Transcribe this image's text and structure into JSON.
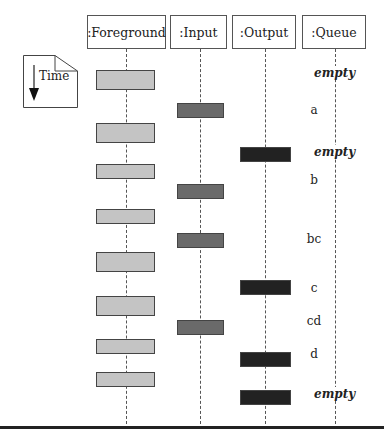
{
  "lifelines": [
    {
      "label": ":Foreground",
      "x": 125
    },
    {
      "label": ":Input",
      "x": 199
    },
    {
      "label": ":Output",
      "x": 265
    },
    {
      "label": ":Queue",
      "x": 335
    }
  ],
  "note": {
    "label": "Time"
  },
  "queue_states": [
    {
      "label": "empty",
      "y": 74,
      "italic": true
    },
    {
      "label": "a",
      "y": 111,
      "italic": false
    },
    {
      "label": "empty",
      "y": 153,
      "italic": true
    },
    {
      "label": "b",
      "y": 181,
      "italic": false
    },
    {
      "label": "bc",
      "y": 240,
      "italic": false
    },
    {
      "label": "c",
      "y": 289,
      "italic": false
    },
    {
      "label": "cd",
      "y": 322,
      "italic": false
    },
    {
      "label": "d",
      "y": 355,
      "italic": false
    },
    {
      "label": "empty",
      "y": 395,
      "italic": true
    }
  ],
  "activations": {
    "foreground": [
      [
        70,
        20
      ],
      [
        123,
        20
      ],
      [
        164,
        15
      ],
      [
        209,
        15
      ],
      [
        252,
        20
      ],
      [
        296,
        20
      ],
      [
        339,
        15
      ],
      [
        372,
        15
      ]
    ],
    "input": [
      [
        103,
        15
      ],
      [
        184,
        15
      ],
      [
        233,
        15
      ],
      [
        320,
        15
      ]
    ],
    "output": [
      [
        147,
        15
      ],
      [
        280,
        15
      ],
      [
        352,
        15
      ],
      [
        390,
        15
      ]
    ]
  }
}
